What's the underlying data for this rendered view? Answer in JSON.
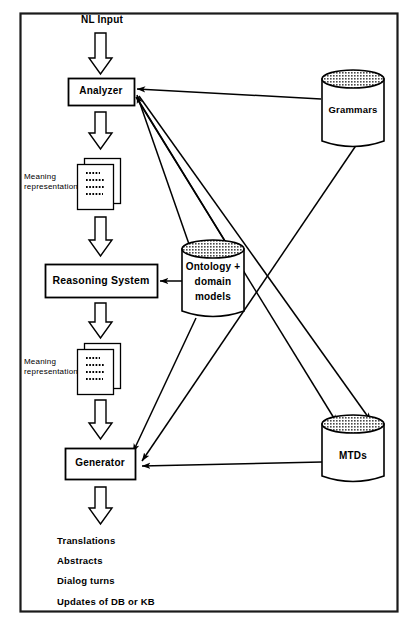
{
  "figure": {
    "frame": {
      "border_color": "#1a1a1a",
      "background": "#ffffff"
    },
    "stroke_color": "#000000"
  },
  "pipeline": {
    "input_label": "NL Input",
    "stages": [
      {
        "id": "analyzer",
        "label": "Analyzer",
        "shape": "box"
      },
      {
        "id": "mr1",
        "label": "Meaning representation",
        "shape": "document-stack"
      },
      {
        "id": "reasoning",
        "label": "Reasoning System",
        "shape": "box"
      },
      {
        "id": "mr2",
        "label": "Meaning representation",
        "shape": "document-stack"
      },
      {
        "id": "generator",
        "label": "Generator",
        "shape": "box"
      }
    ]
  },
  "stores": [
    {
      "id": "grammars",
      "label": "Grammars",
      "shape": "cylinder",
      "top_fill": "stipple"
    },
    {
      "id": "ontology",
      "label": "Ontology + domain models",
      "line1": "Ontology +",
      "line2": "domain",
      "line3": "models",
      "shape": "cylinder",
      "top_fill": "stipple"
    },
    {
      "id": "mtds",
      "label": "MTDs",
      "shape": "cylinder",
      "top_fill": "stipple"
    }
  ],
  "outputs": {
    "items": [
      "Translations",
      "Abstracts",
      "Dialog turns",
      "Updates of DB or KB"
    ]
  },
  "connections": [
    {
      "from": "grammars",
      "to": "analyzer",
      "style": "thin-arrow"
    },
    {
      "from": "ontology",
      "to": "analyzer",
      "style": "thin-arrow"
    },
    {
      "from": "ontology",
      "to": "reasoning",
      "style": "thin-arrow"
    },
    {
      "from": "analyzer",
      "to": "ontology",
      "style": "thin-arrow"
    },
    {
      "from": "analyzer",
      "to": "mtds",
      "style": "thin-arrow"
    },
    {
      "from": "grammars",
      "to": "generator",
      "style": "thin-arrow"
    },
    {
      "from": "ontology",
      "to": "generator",
      "style": "thin-arrow"
    },
    {
      "from": "mtds",
      "to": "generator",
      "style": "thin-arrow"
    },
    {
      "from": "analyzer",
      "to": "mtds",
      "style": "thin-arrow"
    }
  ]
}
